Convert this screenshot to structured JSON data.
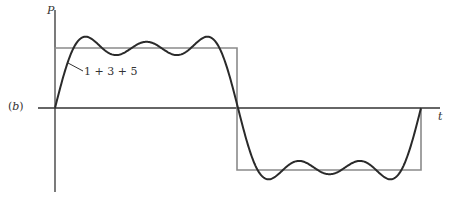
{
  "figure": {
    "panel_label": "(b)",
    "y_axis_label": "P",
    "x_axis_label": "t",
    "curve_annotation": "1 + 3 + 5"
  },
  "colors": {
    "axis": "#333333",
    "square_wave": "#888888",
    "fourier_curve": "#2a2a2a"
  }
}
